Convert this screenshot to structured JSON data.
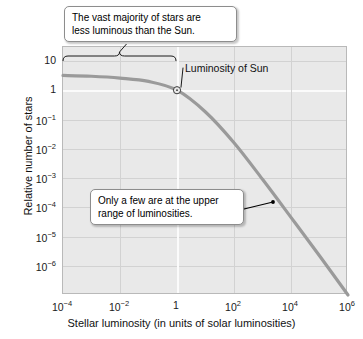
{
  "chart_data": {
    "type": "line",
    "title": "",
    "xlabel": "Stellar luminosity (in units of solar luminosities)",
    "ylabel": "Relative number of stars",
    "xscale": "log",
    "yscale": "log",
    "xlim": [
      0.0001,
      1000000.0
    ],
    "ylim": [
      1e-07,
      30
    ],
    "grid": true,
    "legend_position": "none",
    "xticks": [
      {
        "value": 0.0001,
        "label": "10",
        "exp": "−4"
      },
      {
        "value": 0.01,
        "label": "10",
        "exp": "−2"
      },
      {
        "value": 1,
        "label": "1",
        "exp": ""
      },
      {
        "value": 100.0,
        "label": "10",
        "exp": "2"
      },
      {
        "value": 10000.0,
        "label": "10",
        "exp": "4"
      },
      {
        "value": 1000000.0,
        "label": "10",
        "exp": "6"
      }
    ],
    "yticks": [
      {
        "value": 10,
        "label": "10",
        "exp": ""
      },
      {
        "value": 1,
        "label": "1",
        "exp": ""
      },
      {
        "value": 0.1,
        "label": "10",
        "exp": "−1"
      },
      {
        "value": 0.01,
        "label": "10",
        "exp": "−2"
      },
      {
        "value": 0.001,
        "label": "10",
        "exp": "−3"
      },
      {
        "value": 0.0001,
        "label": "10",
        "exp": "−4"
      },
      {
        "value": 1e-05,
        "label": "10",
        "exp": "−5"
      },
      {
        "value": 1e-06,
        "label": "10",
        "exp": "−6"
      }
    ],
    "series": [
      {
        "name": "Stellar luminosity function",
        "color": "#9a9a9a",
        "points": [
          {
            "x": 0.0001,
            "y": 3.2
          },
          {
            "x": 0.001,
            "y": 3.0
          },
          {
            "x": 0.01,
            "y": 2.6
          },
          {
            "x": 0.1,
            "y": 2.0
          },
          {
            "x": 1,
            "y": 1.0
          },
          {
            "x": 10.0,
            "y": 0.18
          },
          {
            "x": 100.0,
            "y": 0.016
          },
          {
            "x": 1000.0,
            "y": 0.0009
          },
          {
            "x": 10000.0,
            "y": 4.5e-05
          },
          {
            "x": 100000.0,
            "y": 2.2e-06
          },
          {
            "x": 1000000.0,
            "y": 1e-07
          }
        ]
      }
    ],
    "markers": [
      {
        "name": "sun",
        "x": 1,
        "y": 1,
        "label": "Luminosity of Sun",
        "symbol": "sun-symbol"
      }
    ],
    "annotations": [
      {
        "name": "majority-annotation",
        "text": "The vast majority of stars are less luminous than the Sun.",
        "bracket_x_range": [
          0.0001,
          1
        ]
      },
      {
        "name": "upper-range-annotation",
        "text": "Only a few are at the upper range of luminosities.",
        "points_to": {
          "x": 3500.0,
          "y": 0.00015
        }
      }
    ]
  },
  "axes": {
    "x_title": "Stellar luminosity (in units of solar luminosities)",
    "y_title": "Relative number of stars"
  },
  "callouts": {
    "majority": {
      "line1": "The vast majority of stars are",
      "line2": "less luminous than the Sun."
    },
    "few": {
      "line1": "Only a few are at the upper",
      "line2": "range of luminosities."
    }
  },
  "labels": {
    "sun": "Luminosity of Sun"
  },
  "colors": {
    "curve": "#9a9a9a",
    "plot_background": "#e9e9e9",
    "grid": "#d2d2d2",
    "grid_major": "#fbfbfb",
    "frame": "#b9b9b9",
    "annotation_line": "#000000"
  }
}
